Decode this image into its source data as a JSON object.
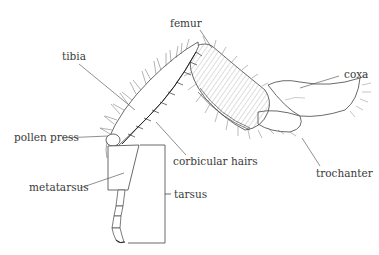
{
  "diagram": {
    "labels": {
      "femur": "femur",
      "tibia": "tibia",
      "coxa": "coxa",
      "pollen_press": "pollen press",
      "corbicular_hairs": "corbicular hairs",
      "trochanter": "trochanter",
      "metatarsus": "metatarsus",
      "tarsus": "tarsus"
    },
    "colors": {
      "ink": "#3a3a3a",
      "hair": "#555555",
      "background": "#ffffff"
    }
  }
}
